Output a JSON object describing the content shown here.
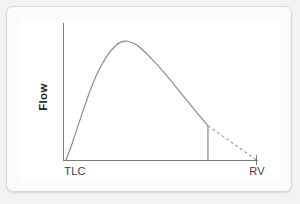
{
  "figure": {
    "title": "",
    "y_axis_label": "Flow",
    "x_tick_labels": {
      "left": "TLC",
      "right": "RV"
    },
    "colors": {
      "curve": "#8c8c8c",
      "axis": "#7a7a7a",
      "dashed": "#a0a0a0",
      "panel_background": "#ffffff",
      "frame_background": "#fbfbfb",
      "frame_border": "#d8d8d8",
      "page_background": "#f3f3f3",
      "label_text": "#3c3c3c",
      "axis_title_text": "#1f1f1f"
    }
  },
  "chart_data": {
    "type": "line",
    "title": "",
    "xlabel": "",
    "ylabel": "Flow",
    "xlim": [
      0,
      1
    ],
    "ylim": [
      0,
      1
    ],
    "grid": false,
    "legend": "none",
    "x_tick_positions": [
      0,
      1
    ],
    "x_tick_labels": [
      "TLC",
      "RV"
    ],
    "y_tick_labels": [],
    "annotations": [
      {
        "name": "premature-termination-dropline",
        "type": "vertical-line",
        "x": 0.745,
        "y_from": 0.0,
        "y_to": 0.27,
        "style": "solid"
      },
      {
        "name": "extrapolated-flow-segment",
        "type": "segment",
        "x_from": 0.745,
        "y_from": 0.27,
        "x_to": 1.0,
        "y_to": 0.0,
        "style": "dashed"
      }
    ],
    "series": [
      {
        "name": "Expiratory flow-volume curve",
        "style": "solid",
        "color": "#8c8c8c",
        "x": [
          0.0,
          0.03,
          0.07,
          0.12,
          0.17,
          0.22,
          0.26,
          0.29,
          0.32,
          0.36,
          0.4,
          0.46,
          0.52,
          0.58,
          0.64,
          0.7,
          0.745
        ],
        "y": [
          0.0,
          0.12,
          0.3,
          0.52,
          0.7,
          0.83,
          0.9,
          0.93,
          0.935,
          0.915,
          0.87,
          0.78,
          0.68,
          0.57,
          0.46,
          0.35,
          0.27
        ]
      },
      {
        "name": "Extrapolated decay to RV",
        "style": "dashed",
        "color": "#a0a0a0",
        "x": [
          0.745,
          1.0
        ],
        "y": [
          0.27,
          0.0
        ]
      }
    ]
  }
}
